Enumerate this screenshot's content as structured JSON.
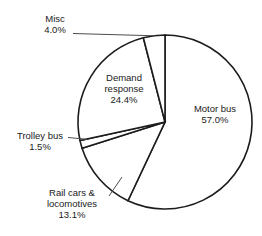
{
  "chart_data": {
    "type": "pie",
    "title": "",
    "xlabel": "",
    "ylabel": "",
    "legend_position": "none",
    "grid": false,
    "start_angle_deg": 0,
    "direction": "clockwise",
    "categories": [
      "Motor bus",
      "Rail cars & locomotives",
      "Trolley bus",
      "Demand response",
      "Misc"
    ],
    "values": [
      57.0,
      13.1,
      1.5,
      24.4,
      4.0
    ],
    "units": "percent",
    "slices": [
      {
        "id": "motor-bus",
        "name": "Motor bus",
        "name_line1": "Motor bus",
        "name_line2": "",
        "value": 57.0,
        "percent_label": "57.0%",
        "label_position": "inside-right",
        "has_leader": false,
        "fill": "#ffffff",
        "stroke": "#1c1c1c"
      },
      {
        "id": "rail-cars-locomotives",
        "name": "Rail cars & locomotives",
        "name_line1": "Rail cars &",
        "name_line2": "locomotives",
        "value": 13.1,
        "percent_label": "13.1%",
        "label_position": "outside-bottom-left",
        "has_leader": true,
        "fill": "#ffffff",
        "stroke": "#1c1c1c"
      },
      {
        "id": "trolley-bus",
        "name": "Trolley bus",
        "name_line1": "Trolley bus",
        "name_line2": "",
        "value": 1.5,
        "percent_label": "1.5%",
        "label_position": "outside-left",
        "has_leader": true,
        "fill": "#ffffff",
        "stroke": "#1c1c1c"
      },
      {
        "id": "demand-response",
        "name": "Demand response",
        "name_line1": "Demand",
        "name_line2": "response",
        "value": 24.4,
        "percent_label": "24.4%",
        "label_position": "inside-upper-left",
        "has_leader": false,
        "fill": "#ffffff",
        "stroke": "#1c1c1c"
      },
      {
        "id": "misc",
        "name": "Misc",
        "name_line1": "Misc",
        "name_line2": "",
        "value": 4.0,
        "percent_label": "4.0%",
        "label_position": "outside-top-left",
        "has_leader": true,
        "fill": "#ffffff",
        "stroke": "#1c1c1c"
      }
    ]
  },
  "geometry": {
    "center_x": 165,
    "center_y": 122,
    "radius": 87
  },
  "colors": {
    "slice_fill": "#ffffff",
    "slice_outline": "#1c1c1c",
    "leader_line": "#4d4d4d",
    "text": "#1a1a1a",
    "background": "#ffffff"
  }
}
